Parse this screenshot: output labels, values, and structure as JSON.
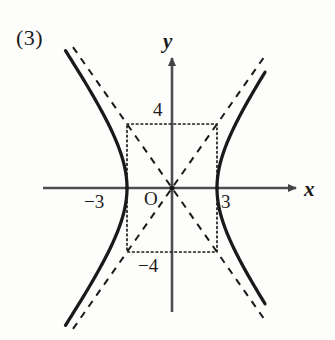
{
  "figure": {
    "problem_number": "(3)",
    "background_color": "#fdfdfb",
    "ink_color": "#1a1a1a",
    "axis_color": "#555555"
  },
  "axes": {
    "x_label": "x",
    "y_label": "y",
    "origin_label": "O",
    "x_axis_arrow": "arrow-right",
    "y_axis_arrow": "arrow-up"
  },
  "tick_labels": {
    "x_negative": "−3",
    "x_positive": "3",
    "y_positive": "4",
    "y_negative": "−4"
  },
  "chart_data": {
    "type": "line",
    "title": "",
    "subtitle": "",
    "xlabel": "x",
    "ylabel": "y",
    "equation": "x^2/9 - y^2/16 = 1",
    "curve_kind": "hyperbola",
    "a": 3,
    "b": 4,
    "xlim": [
      -7.2,
      6.3
    ],
    "ylim": [
      -6.5,
      6.4
    ],
    "grid": false,
    "legend": false,
    "legend_position": "none",
    "origin_px": {
      "x": 172,
      "y": 188
    },
    "scale_px_per_unit": {
      "x": 15.0,
      "y": 16.0
    },
    "vertices": [
      {
        "x": -3,
        "y": 0
      },
      {
        "x": 3,
        "y": 0
      }
    ],
    "x_ticks": [
      -3,
      3
    ],
    "y_ticks": [
      -4,
      4
    ],
    "series": [
      {
        "name": "hyperbola-right-branch",
        "style": "solid",
        "color": "#1a1a1a",
        "points": [
          {
            "x": 3.0,
            "y": 0.0
          },
          {
            "x": 3.05,
            "y": 0.49
          },
          {
            "x": 3.2,
            "y": 1.56
          },
          {
            "x": 3.5,
            "y": 2.71
          },
          {
            "x": 3.9,
            "y": 3.75
          },
          {
            "x": 4.4,
            "y": 4.88
          },
          {
            "x": 5.0,
            "y": 6.0
          },
          {
            "x": 5.6,
            "y": 7.08
          },
          {
            "x": 6.2,
            "y": 8.14
          }
        ]
      },
      {
        "name": "hyperbola-left-branch",
        "style": "solid",
        "color": "#1a1a1a",
        "points": [
          {
            "x": -3.0,
            "y": 0.0
          },
          {
            "x": -3.05,
            "y": 0.49
          },
          {
            "x": -3.2,
            "y": 1.56
          },
          {
            "x": -3.5,
            "y": 2.71
          },
          {
            "x": -3.9,
            "y": 3.75
          },
          {
            "x": -4.4,
            "y": 4.88
          },
          {
            "x": -5.0,
            "y": 6.0
          },
          {
            "x": -5.6,
            "y": 7.08
          },
          {
            "x": -7.1,
            "y": 9.36
          }
        ]
      },
      {
        "name": "asymptote-positive-slope",
        "style": "dashed",
        "color": "#1a1a1a",
        "slope": 1.3333,
        "points": [
          {
            "x": -6.6,
            "y": -8.8
          },
          {
            "x": 6.1,
            "y": 8.13
          }
        ]
      },
      {
        "name": "asymptote-negative-slope",
        "style": "dashed",
        "color": "#1a1a1a",
        "slope": -1.3333,
        "points": [
          {
            "x": -6.6,
            "y": 8.8
          },
          {
            "x": 6.1,
            "y": -8.13
          }
        ]
      }
    ],
    "reference_rectangle": {
      "name": "asymptote-box",
      "style": "dotted",
      "color": "#1a1a1a",
      "corners": [
        {
          "x": -3,
          "y": 4
        },
        {
          "x": 3,
          "y": 4
        },
        {
          "x": 3,
          "y": -4
        },
        {
          "x": -3,
          "y": -4
        }
      ]
    },
    "annotations": [
      {
        "text": "(3)",
        "x_px": 16,
        "y_px": 27,
        "role": "problem-number"
      },
      {
        "text": "O",
        "x_px": 144,
        "y_px": 189,
        "role": "origin-label"
      },
      {
        "text": "4",
        "x_px": 153,
        "y_px": 100,
        "role": "y-tick"
      },
      {
        "text": "−4",
        "x_px": 138,
        "y_px": 256,
        "role": "y-tick"
      },
      {
        "text": "−3",
        "x_px": 84,
        "y_px": 192,
        "role": "x-tick"
      },
      {
        "text": "3",
        "x_px": 221,
        "y_px": 192,
        "role": "x-tick"
      }
    ]
  }
}
